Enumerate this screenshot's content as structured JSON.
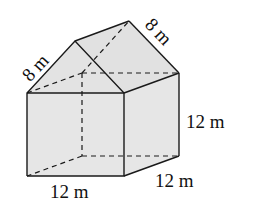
{
  "figure": {
    "type": "3D solid: rectangular prism with triangular prism roof (house shape)",
    "labels": {
      "roof_front_slant": "8 m",
      "roof_back_slant": "8 m",
      "height": "12 m",
      "depth": "12 m",
      "width": "12 m"
    },
    "colors": {
      "face_fill": "#e6e6e6",
      "stroke": "#1a1a1a"
    }
  }
}
